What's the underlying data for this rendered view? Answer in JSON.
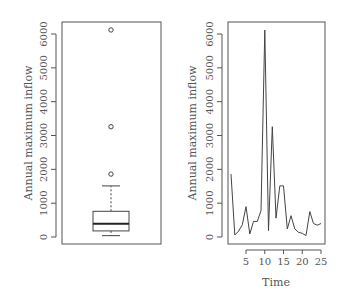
{
  "chart_data": [
    {
      "type": "box",
      "title": "",
      "xlabel": "",
      "ylabel": "Annual maximum inflow",
      "ylim": [
        0,
        6200
      ],
      "yticks": [
        "0",
        "1000",
        "2000",
        "3000",
        "4000",
        "5000",
        "6000"
      ],
      "stats": {
        "min_whisker": 40,
        "q1": 180,
        "median": 390,
        "q3": 760,
        "max_whisker": 1510,
        "outliers": [
          1860,
          3260,
          6120
        ]
      }
    },
    {
      "type": "line",
      "title": "",
      "xlabel": "Time",
      "ylabel": "Annual maximum inflow",
      "xlim": [
        1,
        25
      ],
      "ylim": [
        0,
        6200
      ],
      "xticks": [
        "5",
        "10",
        "15",
        "20",
        "25"
      ],
      "yticks": [
        "0",
        "1000",
        "2000",
        "3000",
        "4000",
        "5000",
        "6000"
      ],
      "x": [
        1,
        2,
        3,
        4,
        5,
        6,
        7,
        8,
        9,
        10,
        11,
        12,
        13,
        14,
        15,
        16,
        17,
        18,
        19,
        20,
        21,
        22,
        23,
        24,
        25
      ],
      "series": [
        {
          "name": "Annual maximum inflow",
          "values": [
            1860,
            60,
            170,
            360,
            900,
            90,
            460,
            460,
            780,
            6120,
            190,
            3260,
            560,
            1510,
            1510,
            240,
            630,
            240,
            140,
            110,
            40,
            750,
            400,
            350,
            400
          ]
        }
      ]
    }
  ],
  "labels": {
    "left_ylabel": "Annual maximum inflow",
    "right_ylabel": "Annual maximum inflow",
    "right_xlabel": "Time"
  },
  "colors": {
    "frame": "#555555",
    "line": "#444444",
    "text": "#555555"
  }
}
